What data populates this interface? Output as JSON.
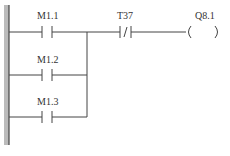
{
  "diagram": {
    "type": "ladder",
    "rungs": [
      {
        "contact": "M1.1",
        "kind": "NO"
      },
      {
        "contact": "M1.2",
        "kind": "NO"
      },
      {
        "contact": "M1.3",
        "kind": "NO"
      }
    ],
    "series_contact": {
      "label": "T37",
      "kind": "NC"
    },
    "coil": {
      "label": "Q8.1"
    }
  }
}
